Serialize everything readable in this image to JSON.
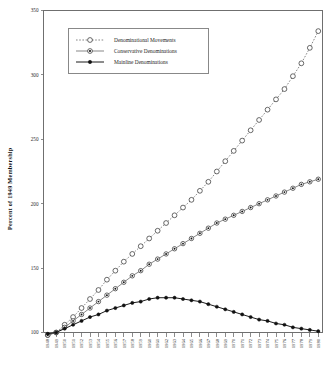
{
  "chart_data": {
    "type": "line",
    "title": "",
    "xlabel": "",
    "ylabel": "Percent of 1949 Membership",
    "ylim": [
      100,
      350
    ],
    "yticks": [
      100,
      150,
      200,
      250,
      300,
      350
    ],
    "ytick_labels": [
      "100",
      "150",
      "200",
      "250",
      "300",
      "350"
    ],
    "grid": false,
    "legend_position": "upper-left-inside",
    "x": [
      1948,
      1949,
      1950,
      1951,
      1952,
      1953,
      1954,
      1955,
      1956,
      1957,
      1958,
      1959,
      1960,
      1961,
      1962,
      1963,
      1964,
      1965,
      1966,
      1967,
      1968,
      1969,
      1970,
      1971,
      1972,
      1973,
      1974,
      1975,
      1976,
      1977,
      1978,
      1979,
      1980
    ],
    "xtick_labels": [
      "1948",
      "1949",
      "1950",
      "1951",
      "1952",
      "1953",
      "1954",
      "1955",
      "1956",
      "1957",
      "1958",
      "1959",
      "1960",
      "1961",
      "1962",
      "1963",
      "1964",
      "1965",
      "1966",
      "1967",
      "1968",
      "1969",
      "1970",
      "1971",
      "1972",
      "1973",
      "1974",
      "1975",
      "1976",
      "1977",
      "1978",
      "1979",
      "1980"
    ],
    "series": [
      {
        "name": "Denominational Movements",
        "marker": "open-circle",
        "line_style": "dotted",
        "values": [
          98,
          100,
          106,
          112,
          119,
          126,
          133,
          141,
          148,
          155,
          161,
          167,
          173,
          179,
          185,
          191,
          197,
          203,
          210,
          217,
          225,
          233,
          241,
          249,
          257,
          265,
          273,
          281,
          289,
          299,
          309,
          321,
          334
        ]
      },
      {
        "name": "Conservative Denominations",
        "marker": "dot-in-circle",
        "line_style": "solid-thin",
        "values": [
          98,
          100,
          104,
          109,
          114,
          119,
          124,
          129,
          134,
          139,
          144,
          148,
          153,
          157,
          161,
          165,
          169,
          173,
          177,
          181,
          185,
          188,
          191,
          194,
          197,
          200,
          203,
          206,
          209,
          212,
          215,
          217,
          219
        ]
      },
      {
        "name": "Mainline Denominations",
        "marker": "filled-circle",
        "line_style": "solid",
        "values": [
          99,
          100,
          103,
          106,
          109,
          112,
          114,
          117,
          119,
          121,
          123,
          124,
          126,
          127,
          127,
          127,
          126,
          125,
          124,
          122,
          120,
          118,
          116,
          114,
          112,
          110,
          109,
          107,
          106,
          104,
          103,
          102,
          101
        ]
      }
    ]
  },
  "legend": {
    "items": [
      {
        "label": "Denominational Movements"
      },
      {
        "label": "Conservative Denominations"
      },
      {
        "label": "Mainline Denominations"
      }
    ]
  }
}
